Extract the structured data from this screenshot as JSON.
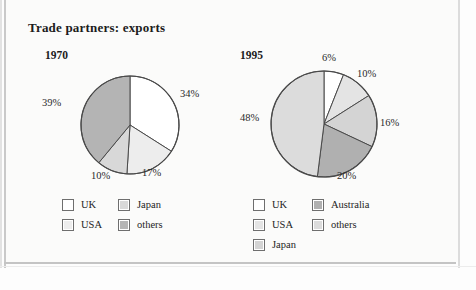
{
  "title": "Trade partners: exports",
  "colors": {
    "uk": "#ffffff",
    "usa": "#ededed",
    "japan": "#d8d8d8",
    "others_1970": "#b4b4b4",
    "australia": "#b0b0b0",
    "others_1995": "#dcdcdc",
    "stroke": "#4a4a4a",
    "text": "#1c1c1c"
  },
  "chart_data": [
    {
      "type": "pie",
      "title": "1970",
      "categories": [
        "UK",
        "USA",
        "Japan",
        "others"
      ],
      "values": [
        34,
        17,
        10,
        39
      ],
      "labels": [
        "34%",
        "17%",
        "10%",
        "39%"
      ],
      "colors": [
        "#ffffff",
        "#ededed",
        "#d8d8d8",
        "#b4b4b4"
      ],
      "start_angle": 0,
      "direction": "clockwise",
      "legend_position": "bottom",
      "units": "percent"
    },
    {
      "type": "pie",
      "title": "1995",
      "categories": [
        "UK",
        "USA",
        "Japan",
        "Australia",
        "others"
      ],
      "values": [
        6,
        10,
        16,
        20,
        48
      ],
      "labels": [
        "6%",
        "10%",
        "16%",
        "20%",
        "48%"
      ],
      "colors": [
        "#ffffff",
        "#e4e4e4",
        "#d4d4d4",
        "#b0b0b0",
        "#dcdcdc"
      ],
      "start_angle": 0,
      "direction": "clockwise",
      "legend_position": "bottom",
      "units": "percent"
    }
  ],
  "chart_1970": {
    "year": "1970",
    "pct": {
      "uk": "34%",
      "usa": "17%",
      "japan": "10%",
      "others": "39%"
    },
    "legend": [
      {
        "label": "UK"
      },
      {
        "label": "USA"
      },
      {
        "label": "Japan"
      },
      {
        "label": "others"
      }
    ]
  },
  "chart_1995": {
    "year": "1995",
    "pct": {
      "uk": "6%",
      "usa": "10%",
      "japan": "16%",
      "australia": "20%",
      "others": "48%"
    },
    "legend": [
      {
        "label": "UK"
      },
      {
        "label": "USA"
      },
      {
        "label": "Japan"
      },
      {
        "label": "Australia"
      },
      {
        "label": "others"
      }
    ]
  }
}
